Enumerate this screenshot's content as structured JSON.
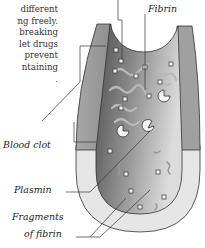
{
  "body_text": {
    "lines": [
      "different",
      "ng freely.",
      "breaking",
      "let drugs",
      "prevent",
      "ntaining",
      "."
    ]
  },
  "labels": {
    "fibrin": "Fibrin",
    "blood_clot": "Blood clot",
    "plasmin": "Plasmin",
    "fragments_line1": "Fragments",
    "fragments_line2": "of fibrin"
  },
  "colors": {
    "vessel_wall": "#9a9a9a",
    "lumen_dark": "#5a5a5a",
    "lumen_light": "#d6d6d6",
    "outer_light": "#e4e4e4",
    "fibrin_strands": "#b8b8b8"
  }
}
